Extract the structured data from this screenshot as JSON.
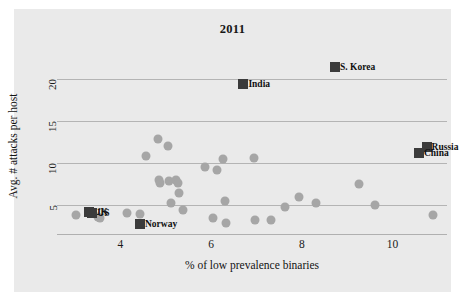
{
  "chart_data": {
    "type": "scatter",
    "title": "2011",
    "xlabel": "% of low prevalence binaries",
    "ylabel": "Avg. # attacks per host",
    "xlim": [
      2.6,
      11.2
    ],
    "ylim": [
      1.6,
      22.5
    ],
    "xticks": [
      4,
      6,
      8,
      10
    ],
    "yticks": [
      5,
      10,
      15,
      20
    ],
    "grid": "horizontal",
    "legend": "none",
    "marker_color": "#a6a6a6",
    "highlight_color": "#3b3b3b",
    "gridline_color": "#b4b4b4",
    "panel_color": "#eaeaea",
    "highlighted": [
      {
        "label": "S. Korea",
        "x": 8.73,
        "y": 21.4
      },
      {
        "label": "India",
        "x": 6.71,
        "y": 19.4
      },
      {
        "label": "Russia",
        "x": 10.75,
        "y": 11.9
      },
      {
        "label": "China",
        "x": 10.58,
        "y": 11.2
      },
      {
        "label": "UK",
        "x": 3.3,
        "y": 4.25
      },
      {
        "label": "US",
        "x": 3.38,
        "y": 4.05
      },
      {
        "label": "Norway",
        "x": 4.43,
        "y": 2.75
      }
    ],
    "points": [
      {
        "x": 3.02,
        "y": 3.85
      },
      {
        "x": 3.5,
        "y": 3.62
      },
      {
        "x": 3.55,
        "y": 3.5
      },
      {
        "x": 4.15,
        "y": 4.1
      },
      {
        "x": 4.44,
        "y": 3.95
      },
      {
        "x": 4.57,
        "y": 10.85
      },
      {
        "x": 4.82,
        "y": 12.9
      },
      {
        "x": 4.85,
        "y": 8.05
      },
      {
        "x": 4.88,
        "y": 7.7
      },
      {
        "x": 5.05,
        "y": 12.05
      },
      {
        "x": 5.07,
        "y": 7.85
      },
      {
        "x": 5.12,
        "y": 5.25
      },
      {
        "x": 5.23,
        "y": 8.05
      },
      {
        "x": 5.27,
        "y": 7.7
      },
      {
        "x": 5.3,
        "y": 6.45
      },
      {
        "x": 5.38,
        "y": 4.4
      },
      {
        "x": 5.86,
        "y": 9.55
      },
      {
        "x": 6.05,
        "y": 3.55
      },
      {
        "x": 6.12,
        "y": 9.15
      },
      {
        "x": 6.25,
        "y": 10.55
      },
      {
        "x": 6.3,
        "y": 5.55
      },
      {
        "x": 6.33,
        "y": 2.95
      },
      {
        "x": 6.95,
        "y": 10.65
      },
      {
        "x": 6.97,
        "y": 3.3
      },
      {
        "x": 7.32,
        "y": 3.25
      },
      {
        "x": 7.62,
        "y": 4.8
      },
      {
        "x": 7.93,
        "y": 6.05
      },
      {
        "x": 8.32,
        "y": 5.25
      },
      {
        "x": 9.25,
        "y": 7.55
      },
      {
        "x": 9.62,
        "y": 5.1
      },
      {
        "x": 10.9,
        "y": 3.8
      }
    ]
  }
}
